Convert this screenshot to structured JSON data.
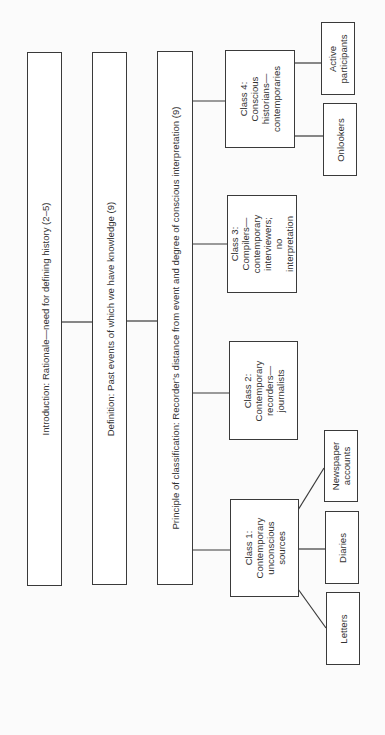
{
  "diagram": {
    "orientation": "rotated-90-ccw",
    "main_boxes": [
      {
        "id": "intro",
        "label": "Introduction: Rationale—need for defining history (2–5)"
      },
      {
        "id": "definition",
        "label": "Definition: Past events of which we have knowledge (9)"
      },
      {
        "id": "principle",
        "label": "Principle of classification: Recorder’s distance from event and degree of conscious interpretation (9)"
      }
    ],
    "classes": [
      {
        "id": "class1",
        "label": "Class 1:\nContemporary\nunconscious\nsources",
        "children": [
          {
            "id": "newspaper",
            "label": "Newspaper\naccounts"
          },
          {
            "id": "diaries",
            "label": "Diaries"
          },
          {
            "id": "letters",
            "label": "Letters"
          }
        ]
      },
      {
        "id": "class2",
        "label": "Class 2:\nContemporary\nrecorders—\njournalists",
        "children": []
      },
      {
        "id": "class3",
        "label": "Class 3:\nCompilers—\ncontemporary\ninterviewers; no\ninterpretation",
        "children": []
      },
      {
        "id": "class4",
        "label": "Class 4:\nConscious\nhistorians—\ncontemporaries",
        "children": [
          {
            "id": "active",
            "label": "Active\nparticipants"
          },
          {
            "id": "onlookers",
            "label": "Onlookers"
          }
        ]
      }
    ]
  }
}
